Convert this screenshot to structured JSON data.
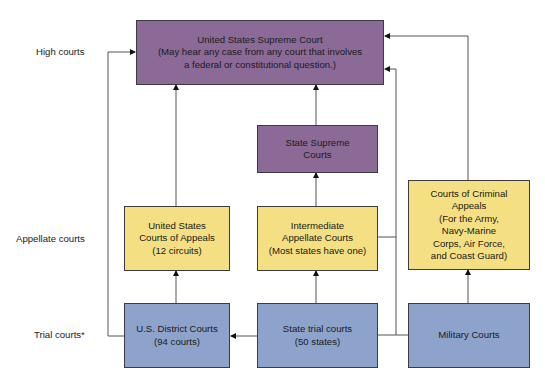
{
  "diagram": {
    "type": "flowchart",
    "levels": [
      {
        "id": "high",
        "label": "High courts"
      },
      {
        "id": "appellate",
        "label": "Appellate courts"
      },
      {
        "id": "trial",
        "label": "Trial courts*"
      }
    ],
    "nodes": {
      "us_supreme": {
        "text": "United States Supreme Court\n(May hear any case from any court that involves\na federal or constitutional question.)",
        "color": "#8c6a97",
        "level": "high"
      },
      "state_supreme": {
        "text": "State Supreme\nCourts",
        "color": "#8c6a97",
        "level": "high"
      },
      "us_appeals": {
        "text": "United States\nCourts of Appeals\n(12 circuits)",
        "color": "#f4df83",
        "level": "appellate"
      },
      "intermediate_appellate": {
        "text": "Intermediate\nAppellate Courts\n(Most states have one)",
        "color": "#f4df83",
        "level": "appellate"
      },
      "criminal_appeals": {
        "text": "Courts of Criminal\nAppeals\n(For the Army,\nNavy-Marine\nCorps, Air Force,\nand Coast Guard)",
        "color": "#f4df83",
        "level": "appellate"
      },
      "us_district": {
        "text": "U.S. District Courts\n(94 courts)",
        "color": "#8ea3cc",
        "level": "trial"
      },
      "state_trial": {
        "text": "State trial courts\n(50 states)",
        "color": "#8ea3cc",
        "level": "trial"
      },
      "military": {
        "text": "Military Courts",
        "color": "#8ea3cc",
        "level": "trial"
      }
    },
    "edges": [
      {
        "from": "us_district",
        "to": "us_appeals"
      },
      {
        "from": "us_appeals",
        "to": "us_supreme"
      },
      {
        "from": "us_district",
        "to": "us_supreme"
      },
      {
        "from": "state_trial",
        "to": "intermediate_appellate"
      },
      {
        "from": "intermediate_appellate",
        "to": "state_supreme"
      },
      {
        "from": "state_supreme",
        "to": "us_supreme"
      },
      {
        "from": "state_trial",
        "to": "us_district"
      },
      {
        "from": "state_trial",
        "to": "us_supreme"
      },
      {
        "from": "intermediate_appellate",
        "to": "us_supreme"
      },
      {
        "from": "military",
        "to": "criminal_appeals"
      },
      {
        "from": "criminal_appeals",
        "to": "us_supreme"
      }
    ]
  }
}
